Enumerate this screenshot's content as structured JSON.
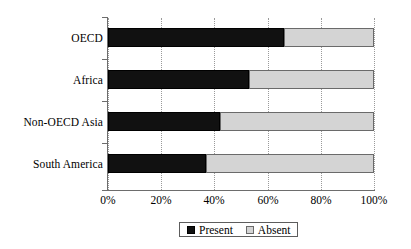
{
  "chart_data": {
    "type": "bar",
    "orientation": "horizontal",
    "stacked": true,
    "stack_total": 100,
    "title": "",
    "subtitle": "",
    "xlabel": "",
    "ylabel": "",
    "xlim": [
      0,
      100
    ],
    "xticks": [
      0,
      20,
      40,
      60,
      80,
      100
    ],
    "xtick_labels": [
      "0%",
      "20%",
      "40%",
      "60%",
      "80%",
      "100%"
    ],
    "grid": "vertical-dotted",
    "legend_position": "bottom-center",
    "categories": [
      "OECD",
      "Africa",
      "Non-OECD Asia",
      "South America"
    ],
    "series": [
      {
        "name": "Present",
        "color": "#111111",
        "values": [
          66,
          53,
          42,
          37
        ]
      },
      {
        "name": "Absent",
        "color": "#d4d4d4",
        "values": [
          34,
          47,
          58,
          63
        ]
      }
    ],
    "legend_entries": [
      "Present",
      "Absent"
    ]
  },
  "axis": {
    "tick_labels": [
      "0%",
      "20%",
      "40%",
      "60%",
      "80%",
      "100%"
    ]
  },
  "legend": {
    "items": [
      {
        "label": "Present",
        "swatch": "filled-black-square"
      },
      {
        "label": "Absent",
        "swatch": "light-gray-square"
      }
    ]
  },
  "colors": {
    "present": "#111111",
    "absent": "#d4d4d4",
    "axis": "#6d6d6d",
    "grid": "#9a9a9a",
    "background": "#ffffff"
  }
}
